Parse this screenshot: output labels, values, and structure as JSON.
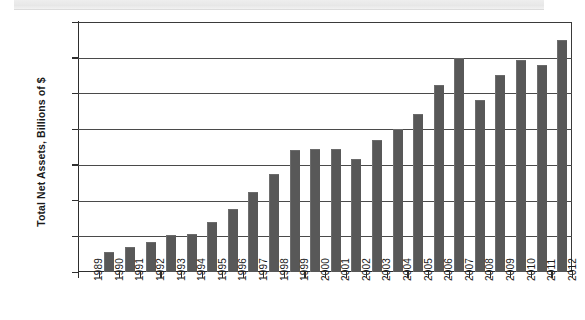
{
  "chart_data": {
    "type": "bar",
    "title": "",
    "subtitle": "",
    "xlabel": "",
    "ylabel": "Total Net Assets, Billions of $",
    "ylim": [
      0,
      14000
    ],
    "yticks": [
      "0",
      "2,000",
      "4,000",
      "6,000",
      "8,000",
      "10,000",
      "12,000",
      "14,000"
    ],
    "ytick_values": [
      0,
      2000,
      4000,
      6000,
      8000,
      10000,
      12000,
      14000
    ],
    "grid": "horizontal",
    "legend": "none",
    "bar_color": "#585858",
    "categories": [
      "1989",
      "1990",
      "1991",
      "1992",
      "1993",
      "1994",
      "1995",
      "1996",
      "1997",
      "1998",
      "1999",
      "2000",
      "2001",
      "2002",
      "2003",
      "2004",
      "2005",
      "2006",
      "2007",
      "2008",
      "2009",
      "2010",
      "2011",
      "2012"
    ],
    "values": [
      0,
      1050,
      1350,
      1600,
      2000,
      2100,
      2750,
      3450,
      4400,
      5450,
      6750,
      6850,
      6850,
      6300,
      7350,
      7950,
      8800,
      10400,
      11950,
      9600,
      11000,
      11800,
      11550,
      12950
    ]
  }
}
